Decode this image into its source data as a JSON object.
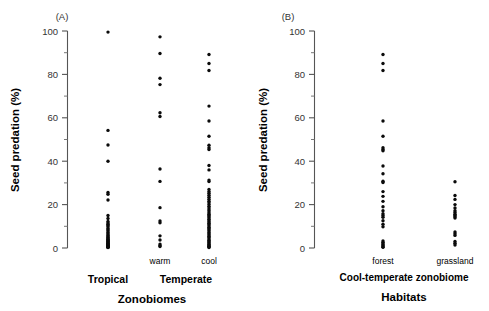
{
  "figure": {
    "type": "scientific-figure",
    "panels": [
      "A",
      "B"
    ]
  },
  "panelA": {
    "tag": "(A)",
    "ylabel": "Seed predation (%)",
    "xtitle": "Zonobiomes",
    "ytick_labels": [
      "100",
      "80",
      "60",
      "40",
      "20",
      "0"
    ],
    "group_labels": [
      "warm",
      "cool"
    ],
    "category_labels": [
      "Tropical",
      "Temperate"
    ]
  },
  "panelB": {
    "tag": "(B)",
    "ylabel": "Seed predation (%)",
    "xtitle": "Habitats",
    "ytick_labels": [
      "100",
      "80",
      "60",
      "40",
      "20",
      "0"
    ],
    "group_labels": [
      "forest",
      "grassland"
    ],
    "category_labels": [
      "Cool-temperate zonobiome"
    ]
  },
  "chart_data": [
    {
      "type": "scatter",
      "title": "(A)",
      "xlabel": "Zonobiomes",
      "ylabel": "Seed predation (%)",
      "ylim": [
        0,
        100
      ],
      "ytick_major": [
        0,
        20,
        40,
        60,
        80,
        100
      ],
      "ytick_minor": [
        10,
        30,
        50,
        70,
        90
      ],
      "grid": false,
      "legend": "none",
      "categories": [
        "Tropical",
        "Temperate warm",
        "Temperate cool"
      ],
      "series": [
        {
          "name": "Tropical",
          "group": "Tropical",
          "values": [
            99.5,
            54.2,
            47.5,
            40.0,
            25.6,
            24.8,
            22.1,
            15.0,
            13.6,
            12.2,
            11.5,
            11.0,
            10.4,
            9.8,
            9.0,
            8.4,
            7.8,
            7.2,
            6.6,
            6.0,
            5.6,
            5.2,
            4.8,
            4.4,
            4.0,
            3.7,
            3.4,
            3.1,
            2.8,
            2.5,
            2.2,
            2.0,
            1.8,
            1.6,
            1.4,
            1.2,
            1.0,
            0.8,
            0.6,
            0.4,
            0.3,
            0.2
          ]
        },
        {
          "name": "Temperate warm",
          "group": "Temperate",
          "subgroup": "warm",
          "values": [
            97.3,
            89.6,
            78.2,
            75.3,
            62.3,
            60.6,
            36.4,
            30.7,
            18.6,
            12.5,
            11.6,
            5.6,
            3.7,
            1.8,
            1.2,
            0.7
          ]
        },
        {
          "name": "Temperate cool",
          "group": "Temperate",
          "subgroup": "cool",
          "values": [
            89.2,
            85.0,
            81.8,
            65.4,
            58.5,
            51.5,
            47.4,
            46.2,
            45.4,
            38.0,
            36.0,
            31.3,
            30.6,
            27.0,
            26.0,
            25.2,
            24.3,
            23.4,
            22.5,
            21.6,
            20.8,
            20.0,
            19.2,
            18.4,
            17.6,
            17.0,
            16.3,
            15.6,
            15.0,
            14.4,
            13.8,
            13.2,
            12.6,
            12.0,
            11.4,
            10.8,
            10.2,
            9.6,
            9.0,
            8.4,
            7.8,
            7.2,
            6.6,
            6.0,
            5.4,
            4.8,
            4.2,
            3.6,
            3.0,
            2.5,
            2.0,
            1.6,
            1.2,
            0.8,
            0.5,
            0.2
          ]
        }
      ]
    },
    {
      "type": "scatter",
      "title": "(B)",
      "xlabel": "Habitats",
      "ylabel": "Seed predation (%)",
      "ylim": [
        0,
        100
      ],
      "ytick_major": [
        0,
        20,
        40,
        60,
        80,
        100
      ],
      "ytick_minor": [
        10,
        30,
        50,
        70,
        90
      ],
      "grid": false,
      "legend": "none",
      "categories": [
        "forest",
        "grassland"
      ],
      "series": [
        {
          "name": "forest",
          "group": "Cool-temperate zonobiome",
          "values": [
            89.2,
            85.0,
            81.8,
            58.5,
            51.5,
            46.2,
            45.4,
            44.8,
            37.8,
            34.2,
            30.8,
            30.2,
            26.0,
            23.8,
            21.5,
            19.0,
            17.2,
            15.8,
            15.0,
            14.2,
            12.6,
            11.0,
            9.8,
            3.2,
            2.6,
            2.0,
            1.5,
            1.0,
            0.6,
            0.3
          ]
        },
        {
          "name": "grassland",
          "group": "Cool-temperate zonobiome",
          "values": [
            30.5,
            24.2,
            22.4,
            20.0,
            18.4,
            17.2,
            16.4,
            15.6,
            15.0,
            14.4,
            13.8,
            7.4,
            6.6,
            5.8,
            3.0,
            2.2,
            1.4
          ]
        }
      ]
    }
  ]
}
